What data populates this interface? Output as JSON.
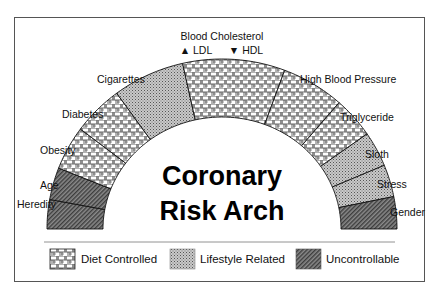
{
  "diagram": {
    "title_lines": [
      "Coronary",
      "Risk Arch"
    ],
    "top_label": {
      "title": "Blood Cholesterol",
      "sub_left": "▲ LDL",
      "sub_right": "▼ HDL"
    },
    "categories": {
      "diet": {
        "label": "Diet Controlled",
        "pattern": "brick-crosshatch"
      },
      "lifestyle": {
        "label": "Lifestyle Related",
        "pattern": "fine-dot"
      },
      "uncontrollable": {
        "label": "Uncontrollable",
        "pattern": "dark-diagonal"
      }
    },
    "segments": [
      {
        "label": "Heredity",
        "category": "uncontrollable",
        "start_deg": 180,
        "end_deg": 170
      },
      {
        "label": "Age",
        "category": "uncontrollable",
        "start_deg": 170,
        "end_deg": 159
      },
      {
        "label": "Obesity",
        "category": "diet",
        "start_deg": 159,
        "end_deg": 144
      },
      {
        "label": "Diabetes",
        "category": "diet",
        "start_deg": 144,
        "end_deg": 127
      },
      {
        "label": "Cigarettes",
        "category": "lifestyle",
        "start_deg": 127,
        "end_deg": 103
      },
      {
        "label": "Blood Cholesterol",
        "category": "diet",
        "start_deg": 103,
        "end_deg": 69
      },
      {
        "label": "High Blood Pressure",
        "category": "diet",
        "start_deg": 69,
        "end_deg": 48
      },
      {
        "label": "Triglyceride",
        "category": "diet",
        "start_deg": 48,
        "end_deg": 34
      },
      {
        "label": "Sloth",
        "category": "lifestyle",
        "start_deg": 34,
        "end_deg": 22
      },
      {
        "label": "Stress",
        "category": "lifestyle",
        "start_deg": 22,
        "end_deg": 11
      },
      {
        "label": "Gender",
        "category": "uncontrollable",
        "start_deg": 11,
        "end_deg": 0
      }
    ],
    "labels": {
      "heredity": "Heredity",
      "age": "Age",
      "obesity": "Obesity",
      "diabetes": "Diabetes",
      "cigarettes": "Cigarettes",
      "high_blood_pressure": "High Blood Pressure",
      "triglyceride": "Triglyceride",
      "sloth": "Sloth",
      "stress": "Stress",
      "gender": "Gender"
    },
    "legend": [
      {
        "label": "Diet Controlled",
        "category": "diet"
      },
      {
        "label": "Lifestyle Related",
        "category": "lifestyle"
      },
      {
        "label": "Uncontrollable",
        "category": "uncontrollable"
      }
    ],
    "colors": {
      "border": "#555555",
      "outline": "#111111",
      "lifestyle_fill": "#b8b8b8",
      "uncontrollable_fill": "#7a7a7a",
      "diet_bg": "#ffffff"
    }
  }
}
